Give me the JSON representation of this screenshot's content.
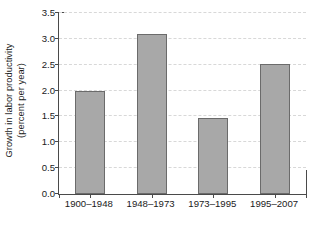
{
  "chart_data": {
    "type": "bar",
    "title": "",
    "xlabel": "",
    "ylabel": "Growth in labor productivity (percent per year)",
    "ylabel_line1": "Growth in labor productivity",
    "ylabel_line2": "(percent per year)",
    "categories": [
      "1900–1948",
      "1948–1973",
      "1973–1995",
      "1995–2007"
    ],
    "values": [
      2.0,
      3.1,
      1.47,
      2.51
    ],
    "ylim": [
      0.0,
      3.5
    ],
    "yticks": [
      0.0,
      0.5,
      1.0,
      1.5,
      2.0,
      2.5,
      3.0,
      3.5
    ],
    "ytick_labels": [
      "0.0",
      "0.5",
      "1.0",
      "1.5",
      "2.0",
      "2.5",
      "3.0",
      "3.5"
    ],
    "grid": true,
    "grid_axis": "y",
    "grid_style": "dashed",
    "legend": false,
    "legend_position": "none",
    "bar_color": "#a8a8a8",
    "bar_edge_color": "#6b6b6b",
    "grid_color": "#d8d8d8",
    "axis_color": "#4a4a4a",
    "background_color": "#ffffff"
  }
}
